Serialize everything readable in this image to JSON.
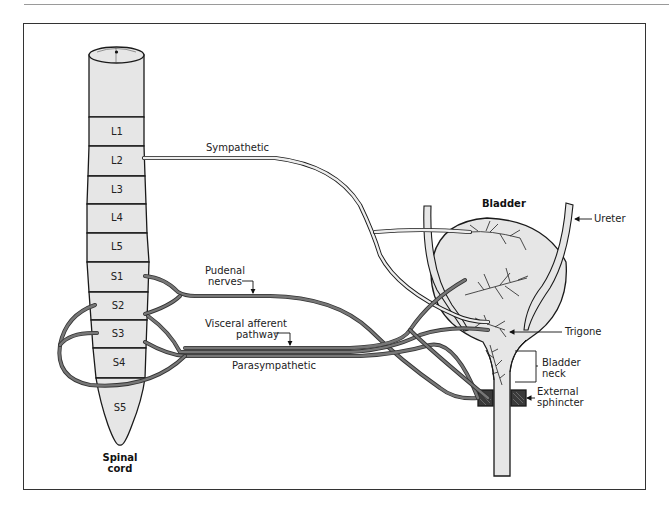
{
  "figure": {
    "title": "Bladder",
    "spinal_cord_label_line1": "Spinal",
    "spinal_cord_label_line2": "cord"
  },
  "segments": [
    {
      "label": "L1"
    },
    {
      "label": "L2"
    },
    {
      "label": "L3"
    },
    {
      "label": "L4"
    },
    {
      "label": "L5"
    },
    {
      "label": "S1"
    },
    {
      "label": "S2"
    },
    {
      "label": "S3"
    },
    {
      "label": "S4"
    },
    {
      "label": "S5"
    }
  ],
  "nerves": {
    "sympathetic": "Sympathetic",
    "pudenal_line1": "Pudenal",
    "pudenal_line2": "nerves",
    "visceral_line1": "Visceral afferent",
    "visceral_line2": "pathway",
    "parasympathetic": "Parasympathetic"
  },
  "anatomy": {
    "ureter": "Ureter",
    "trigone": "Trigone",
    "bladder_neck_line1": "Bladder",
    "bladder_neck_line2": "neck",
    "external_sphincter_line1": "External",
    "external_sphincter_line2": "sphincter"
  },
  "colors": {
    "fill": "#e6e6e6",
    "nerve_dark": "#6e6e6e",
    "nerve_light": "#d8d8d8",
    "outline": "#1a1a1a"
  }
}
